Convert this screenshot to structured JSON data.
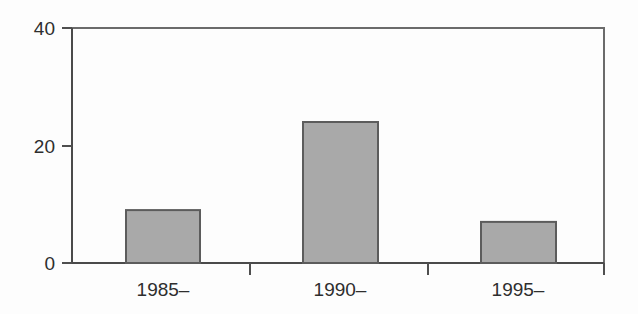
{
  "chart_data": {
    "type": "bar",
    "title": "",
    "subtitle": "",
    "xlabel": "",
    "ylabel": "",
    "categories": [
      "1985–",
      "1990–",
      "1995–"
    ],
    "values": [
      9,
      24,
      7
    ],
    "series": [
      {
        "name": "",
        "values": [
          9,
          24,
          7
        ]
      }
    ],
    "ylim": [
      0,
      40
    ],
    "y_ticks": [
      0,
      20,
      40
    ],
    "y_tick_labels": [
      "0",
      "20",
      "40"
    ],
    "x_tick_labels": [
      "1985–",
      "1990–",
      "1995–"
    ],
    "grid": false,
    "legend": false,
    "legend_position": "none",
    "bar_fill_color": "#a9a9a9",
    "bar_edge_color": "#5c5c5c",
    "axis_color": "#4a4a4a",
    "frame_color": "#6b6b6b",
    "text_color": "#2e2e2e",
    "background_color": "#ffffff"
  },
  "axis": {
    "y_labels": [
      "40",
      "20",
      "0"
    ],
    "x_labels": [
      "1985–",
      "1990–",
      "1995–"
    ]
  }
}
